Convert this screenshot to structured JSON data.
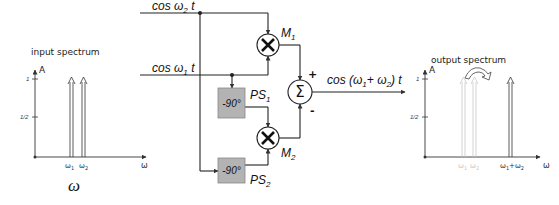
{
  "input_spectrum": {
    "title": "input spectrum",
    "y_label": "A",
    "ticks": {
      "one": "1",
      "half": "1/2"
    },
    "x_label": "ω",
    "peaks": [
      {
        "label": "ω",
        "sub": "1",
        "amplitude": 1
      },
      {
        "label": "ω",
        "sub": "2",
        "amplitude": 1
      }
    ]
  },
  "caption_symbol": "ω",
  "block_diagram": {
    "input_top": {
      "prefix": "cos ω",
      "sub": "2",
      "suffix": " t"
    },
    "input_bottom": {
      "prefix": "cos ω",
      "sub": "1",
      "suffix": " t"
    },
    "mixer1": {
      "symbol": "×",
      "label": "M",
      "sub": "1"
    },
    "mixer2": {
      "symbol": "×",
      "label": "M",
      "sub": "2"
    },
    "phase_shifter1": {
      "value": "-90°",
      "label": "PS",
      "sub": "1"
    },
    "phase_shifter2": {
      "value": "-90°",
      "label": "PS",
      "sub": "2"
    },
    "summer": {
      "symbol": "Σ",
      "plus": "+",
      "minus": "-"
    },
    "output": {
      "p1": "cos (ω",
      "s1": "1",
      "p2": "+ ω",
      "s2": "2",
      "p3": ") t"
    }
  },
  "output_spectrum": {
    "title": "output spectrum",
    "y_label": "A",
    "ticks": {
      "one": "1",
      "half": "1/2"
    },
    "x_label": "ω",
    "ghost_peaks": [
      {
        "label": "ω",
        "sub": "1"
      },
      {
        "label": "ω",
        "sub": "2"
      }
    ],
    "sum_peak": {
      "l1": "ω",
      "s1": "1",
      "mid": "+ω",
      "s2": "2",
      "amplitude": 1
    }
  },
  "colors": {
    "line": "#222222",
    "box_fill": "#b3b3b3",
    "ghost": "#c8c8c8"
  }
}
